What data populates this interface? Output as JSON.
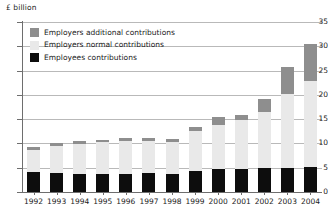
{
  "chart_data": {
    "type": "bar",
    "stacked": true,
    "title": "",
    "subtitle": "",
    "xlabel": "",
    "ylabel": "£ billion",
    "ylim": [
      0,
      35
    ],
    "ytick_step": 5,
    "yticks": [
      0,
      5,
      10,
      15,
      20,
      25,
      30,
      35
    ],
    "grid": true,
    "legend_position": "top-left",
    "categories": [
      "1992",
      "1993",
      "1994",
      "1995",
      "1996",
      "1997",
      "1998",
      "1999",
      "2000",
      "2001",
      "2002",
      "2003",
      "2004"
    ],
    "series": [
      {
        "name": "Employees contributions",
        "key": "employees",
        "color": "#0d0d0d",
        "values": [
          4.1,
          4.0,
          3.7,
          3.7,
          3.7,
          3.9,
          3.7,
          4.4,
          4.8,
          4.7,
          4.9,
          5.0,
          5.1
        ]
      },
      {
        "name": "Employers normal contributions",
        "key": "normal",
        "color": "#e9e9e9",
        "values": [
          4.6,
          5.5,
          6.2,
          6.5,
          6.9,
          6.7,
          6.6,
          8.1,
          9.1,
          10.1,
          11.6,
          15.1,
          17.7
        ]
      },
      {
        "name": "Employers additional contributions",
        "key": "additional",
        "color": "#8e8e8e",
        "values": [
          0.5,
          0.6,
          0.7,
          0.6,
          0.5,
          0.6,
          0.6,
          0.9,
          1.5,
          1.1,
          2.7,
          5.7,
          7.7
        ]
      }
    ],
    "totals": [
      9.2,
      10.1,
      10.6,
      10.8,
      11.1,
      11.2,
      10.9,
      13.4,
      15.4,
      15.9,
      19.2,
      25.8,
      30.5
    ]
  },
  "legend": {
    "items": [
      {
        "label": "Employers additional contributions",
        "key": "additional"
      },
      {
        "label": "Employers normal contributions",
        "key": "normal"
      },
      {
        "label": "Employees contributions",
        "key": "employees"
      }
    ]
  },
  "axes": {
    "y_unit_label": "£ billion"
  }
}
